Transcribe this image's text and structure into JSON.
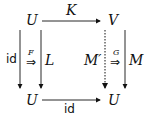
{
  "diagram": {
    "type": "commutative-diagram",
    "nodes": {
      "top_left": "U",
      "top_right": "V",
      "bottom_left": "U",
      "bottom_right": "U"
    },
    "arrows": {
      "top": "K",
      "bottom": "id",
      "left_outer": "id",
      "left_inner": "L",
      "right_inner": "M′",
      "right_outer": "M"
    },
    "two_cells": {
      "left": "F",
      "right": "G"
    },
    "double_arrow_glyph": "⇒"
  }
}
